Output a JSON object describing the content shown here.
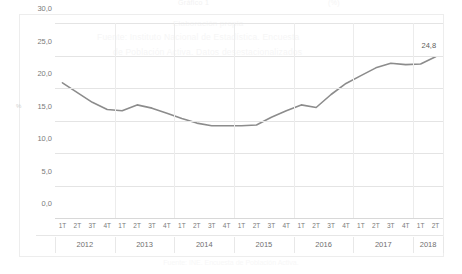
{
  "top_band": {
    "left_text": "Gráfico 1",
    "right_text": "(%)"
  },
  "watermark": {
    "line1": "Elaboración propia",
    "line2": "Fuente: Instituto Nacional de Estadística. Encuesta",
    "line3": "de Población Activa. Datos desestacionalizados"
  },
  "bottom_caption": "Fuente: INE. Encuesta de Población Activa.",
  "chart_data": {
    "type": "line",
    "title": "",
    "xlabel": "",
    "ylabel": "%",
    "ylim": [
      0.0,
      30.0
    ],
    "yticks": [
      0.0,
      5.0,
      10.0,
      15.0,
      20.0,
      25.0,
      30.0
    ],
    "ytick_labels": [
      "0,0",
      "5,0",
      "10,0",
      "15,0",
      "20,0",
      "25,0",
      "30,0"
    ],
    "grid": true,
    "legend": "none",
    "decimal_separator": ",",
    "series_color": "#8c8c8c",
    "quarter_labels": [
      "1T",
      "2T",
      "3T",
      "4T",
      "1T",
      "2T",
      "3T",
      "4T",
      "1T",
      "2T",
      "3T",
      "4T",
      "1T",
      "2T",
      "3T",
      "4T",
      "1T",
      "2T",
      "3T",
      "4T",
      "1T",
      "2T",
      "3T",
      "4T",
      "1T",
      "2T"
    ],
    "year_groups": [
      {
        "year": "2012",
        "quarters": 4
      },
      {
        "year": "2013",
        "quarters": 4
      },
      {
        "year": "2014",
        "quarters": 4
      },
      {
        "year": "2015",
        "quarters": 4
      },
      {
        "year": "2016",
        "quarters": 4
      },
      {
        "year": "2017",
        "quarters": 4
      },
      {
        "year": "2018",
        "quarters": 2
      }
    ],
    "x": [
      "2012 1T",
      "2012 2T",
      "2012 3T",
      "2012 4T",
      "2013 1T",
      "2013 2T",
      "2013 3T",
      "2013 4T",
      "2014 1T",
      "2014 2T",
      "2014 3T",
      "2014 4T",
      "2015 1T",
      "2015 2T",
      "2015 3T",
      "2015 4T",
      "2016 1T",
      "2016 2T",
      "2016 3T",
      "2016 4T",
      "2017 1T",
      "2017 2T",
      "2017 3T",
      "2017 4T",
      "2018 1T",
      "2018 2T"
    ],
    "values": [
      20.8,
      19.3,
      17.8,
      16.7,
      16.5,
      17.4,
      16.9,
      16.1,
      15.3,
      14.6,
      14.2,
      14.2,
      14.2,
      14.3,
      15.5,
      16.5,
      17.4,
      17.0,
      19.0,
      20.7,
      21.9,
      23.1,
      23.8,
      23.6,
      23.7,
      24.8
    ],
    "data_labels": [
      {
        "index": 25,
        "text": "24,8"
      }
    ]
  }
}
